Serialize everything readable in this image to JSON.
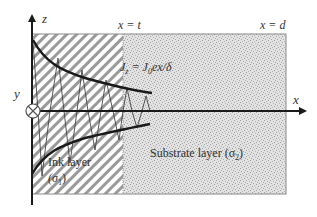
{
  "diagram": {
    "axes": {
      "z_label": "z",
      "x_label": "x",
      "y_label": "y"
    },
    "boundaries": {
      "ink_substrate": "x = t",
      "substrate_end": "x = d"
    },
    "equation": {
      "lhs": "J",
      "lhs_sub": "z",
      "eq": " = ",
      "rhs": "J",
      "rhs_sub": "0",
      "rhs_tail": "ex/δ"
    },
    "layers": {
      "ink": {
        "name": "Ink layer",
        "sigma": "(σ",
        "sigma_sub": "1",
        "sigma_close": ")"
      },
      "substrate": {
        "name": "Substrate layer (σ",
        "sigma_sub": "2",
        "sigma_close": ")"
      }
    },
    "colors": {
      "hatch": "#8a8a8a",
      "stipple_bg": "#dcdcdc",
      "stipple_dot": "#a8a8a8",
      "curve": "#1a1a1a",
      "border": "#888888"
    }
  }
}
